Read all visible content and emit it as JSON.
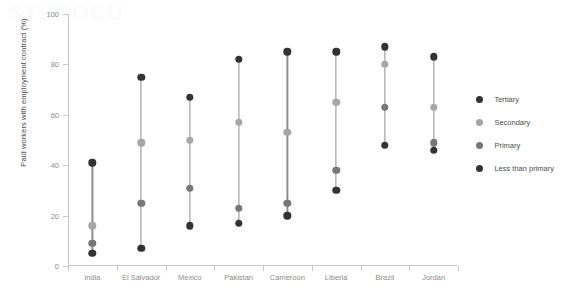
{
  "watermark": "STUDOCU",
  "chart_data": {
    "type": "scatter",
    "title": "",
    "xlabel": "",
    "ylabel": "Paid workers with employment contract (%)",
    "ylim": [
      0,
      100
    ],
    "yticks": [
      0,
      20,
      40,
      60,
      80,
      100
    ],
    "ytick_labels": [
      "0",
      "20",
      "40",
      "60",
      "80",
      "100"
    ],
    "grid": false,
    "legend_position": "right",
    "categories": [
      "India",
      "El Salvador",
      "Mexico",
      "Pakistan",
      "Cameroon",
      "Liberia",
      "Brazil",
      "Jordan"
    ],
    "series": [
      {
        "name": "Tertiary",
        "color": "#333333",
        "values": [
          41,
          75,
          67,
          82,
          85,
          85,
          87,
          83
        ]
      },
      {
        "name": "Secondary",
        "color": "#a6a6a6",
        "values": [
          16,
          49,
          50,
          57,
          53,
          65,
          80,
          63
        ]
      },
      {
        "name": "Primary",
        "color": "#777777",
        "values": [
          9,
          25,
          31,
          23,
          25,
          38,
          63,
          49
        ]
      },
      {
        "name": "Less than primary",
        "color": "#333333",
        "values": [
          5,
          7,
          16,
          17,
          20,
          30,
          48,
          46
        ]
      }
    ]
  }
}
